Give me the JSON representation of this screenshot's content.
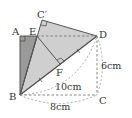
{
  "figure": {
    "type": "geometry-folding-diagram",
    "points": {
      "A": {
        "label": "A",
        "x": 20,
        "y": 36
      },
      "E": {
        "label": "E",
        "x": 37,
        "y": 36
      },
      "C_prime": {
        "label": "C′",
        "x": 42,
        "y": 20
      },
      "D": {
        "label": "D",
        "x": 97,
        "y": 36
      },
      "F": {
        "label": "F",
        "x": 60,
        "y": 64
      },
      "B": {
        "label": "B",
        "x": 20,
        "y": 95
      },
      "C": {
        "label": "C",
        "x": 97,
        "y": 95
      }
    },
    "measurements": {
      "DC": "6cm",
      "BD": "10cm",
      "BC": "8cm"
    },
    "colors": {
      "dark_fill": "#9a9a9a",
      "light_fill": "#cfcfcf",
      "stroke": "#555555",
      "dashed": "#777777"
    }
  }
}
